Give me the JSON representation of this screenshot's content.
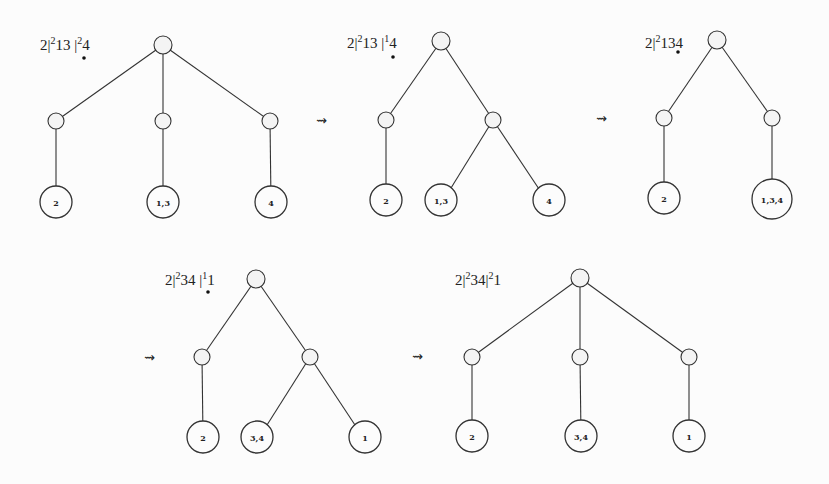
{
  "diagram": {
    "type": "tree-sequence",
    "transition_symbol": "⇝",
    "trees": [
      {
        "id": "t1",
        "label": {
          "base": "2|",
          "sup1": "2",
          "mid": "13 |",
          "sup2": "2",
          "tail": "4",
          "has_dot": true
        },
        "leaves": [
          "2",
          "1,3",
          "4"
        ],
        "structure": "root -> [m1 -> 2, m2 -> 1,3, m3 -> 4]"
      },
      {
        "id": "t2",
        "label": {
          "base": "2|",
          "sup1": "2",
          "mid": "13 |",
          "sup2": "1",
          "tail": "4",
          "has_dot": true
        },
        "leaves": [
          "2",
          "1,3",
          "4"
        ],
        "structure": "root -> [m1 -> 2, m2 -> [1,3 ; 4]]"
      },
      {
        "id": "t3",
        "label": {
          "base": "2|",
          "sup1": "2",
          "mid": "134",
          "sup2": "",
          "tail": "",
          "has_dot": true
        },
        "leaves": [
          "2",
          "1,3,4"
        ],
        "structure": "root -> [m1 -> 2, m2 -> 1,3,4]"
      },
      {
        "id": "t4",
        "label": {
          "base": "2|",
          "sup1": "2",
          "mid": "34 |",
          "sup2": "1",
          "tail": "1",
          "has_dot": true
        },
        "leaves": [
          "2",
          "3,4",
          "1"
        ],
        "structure": "root -> [m1 -> 2, m2 -> [3,4 ; 1]]"
      },
      {
        "id": "t5",
        "label": {
          "base": "2|",
          "sup1": "2",
          "mid": "34|",
          "sup2": "2",
          "tail": "1",
          "has_dot": false
        },
        "leaves": [
          "2",
          "3,4",
          "1"
        ],
        "structure": "root -> [m1 -> 2, m2 -> 3,4, m3 -> 1]"
      }
    ]
  }
}
